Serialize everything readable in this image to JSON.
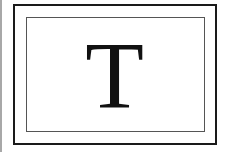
{
  "icon": {
    "name": "text-tool-icon",
    "glyph": "T",
    "colors": {
      "glyph": "#111111",
      "outer_border": "#1a1a1a",
      "inner_border": "#555555",
      "background": "#ffffff"
    }
  }
}
